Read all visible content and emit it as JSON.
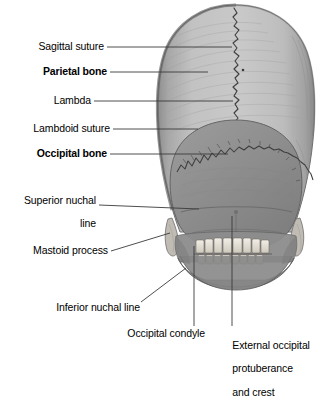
{
  "figure": {
    "background_color": "#ffffff",
    "text_color": "#000000",
    "leader_line_color": "#3a3a3a",
    "bone_colors": {
      "parietal_bone": "#b9b9b9",
      "occipital_bone": "#8f8f8f",
      "suture_line": "#4a4a4a",
      "teeth": "#eeeae2",
      "shadow": "#6e6e6e"
    }
  },
  "labels": [
    {
      "id": "sagittal-suture",
      "text": "Sagittal suture",
      "bold": false,
      "align": "right",
      "lines": [
        "Sagittal suture"
      ]
    },
    {
      "id": "parietal-bone",
      "text": "Parietal bone",
      "bold": true,
      "align": "right",
      "lines": [
        "Parietal bone"
      ]
    },
    {
      "id": "lambda",
      "text": "Lambda",
      "bold": false,
      "align": "right",
      "lines": [
        "Lambda"
      ]
    },
    {
      "id": "lambdoid-suture",
      "text": "Lambdoid suture",
      "bold": false,
      "align": "right",
      "lines": [
        "Lambdoid suture"
      ]
    },
    {
      "id": "occipital-bone",
      "text": "Occipital bone",
      "bold": true,
      "align": "right",
      "lines": [
        "Occipital bone"
      ]
    },
    {
      "id": "superior-nuchal-line",
      "text": "Superior nuchal line",
      "bold": false,
      "align": "right",
      "lines": [
        "Superior nuchal",
        "line"
      ]
    },
    {
      "id": "mastoid-process",
      "text": "Mastoid process",
      "bold": false,
      "align": "right",
      "lines": [
        "Mastoid process"
      ]
    },
    {
      "id": "inferior-nuchal-line",
      "text": "Inferior nuchal line",
      "bold": false,
      "align": "right",
      "lines": [
        "Inferior nuchal line"
      ]
    },
    {
      "id": "occipital-condyle",
      "text": "Occipital condyle",
      "bold": false,
      "align": "right",
      "lines": [
        "Occipital condyle"
      ]
    },
    {
      "id": "external-occipital-protuberance",
      "text": "External occipital protuberance and crest",
      "bold": false,
      "align": "left",
      "lines": [
        "External occipital",
        "protuberance",
        "and crest"
      ]
    }
  ],
  "label_text": {
    "sagittal_suture": "Sagittal suture",
    "parietal_bone": "Parietal bone",
    "lambda": "Lambda",
    "lambdoid_suture": "Lambdoid suture",
    "occipital_bone": "Occipital bone",
    "superior_nuchal_line_1": "Superior nuchal",
    "superior_nuchal_line_2": "line",
    "mastoid_process": "Mastoid process",
    "inferior_nuchal_line": "Inferior nuchal line",
    "occipital_condyle": "Occipital condyle",
    "external_occipital_1": "External occipital",
    "external_occipital_2": "protuberance",
    "external_occipital_3": "and crest"
  }
}
